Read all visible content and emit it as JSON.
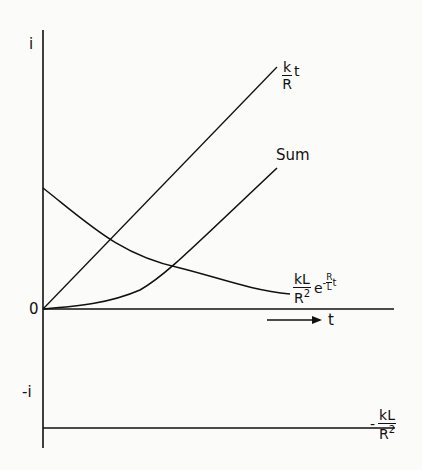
{
  "figure": {
    "y_axis_top_label": "i",
    "y_axis_bottom_label": "-i",
    "origin_label": "0",
    "x_axis_label": "t",
    "curves": {
      "linear": {
        "label_num": "k",
        "label_den": "R",
        "label_var": "t"
      },
      "sum": {
        "label": "Sum"
      },
      "exponential": {
        "label_num": "kL",
        "label_den": "R",
        "label_den_sup": "2",
        "label_e": "e",
        "label_minus": "-",
        "exp_num": "R",
        "exp_den": "L",
        "exp_var": "t"
      },
      "constant": {
        "label_minus": "-",
        "label_num": "kL",
        "label_den": "R",
        "label_den_sup": "2"
      }
    },
    "colors": {
      "ink": "#111111",
      "background": "#fbfbf9"
    }
  }
}
